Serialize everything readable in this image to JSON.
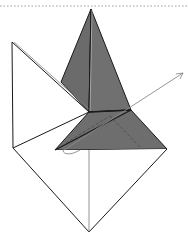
{
  "diagram": {
    "title": "",
    "colors": {
      "background": "#ffffff",
      "dark_face": "#6b6b6b",
      "dark_face_light": "#767676",
      "stroke": "#1a1a1a",
      "thin_stroke": "#555555",
      "arrow": "#8a8a8a",
      "top_dotted_line": "#9a9a9a"
    },
    "shapes": {
      "top_dotted_border": {
        "y": 6
      },
      "apex": [
        91,
        9
      ],
      "left_top": [
        12,
        42
      ],
      "left_bottom": [
        13,
        148
      ],
      "bottom": [
        89,
        232
      ],
      "right": [
        167,
        149
      ],
      "center_left": [
        89,
        112
      ],
      "center_right": [
        131,
        110
      ],
      "pyramid_left_base": [
        61,
        82
      ],
      "lower_left": [
        55,
        150
      ],
      "arrow_tip": [
        183,
        73
      ]
    }
  }
}
